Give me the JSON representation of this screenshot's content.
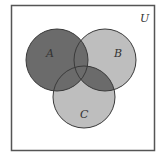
{
  "diagram": {
    "type": "venn",
    "universe_label": "U",
    "sets": [
      {
        "name": "A",
        "label": "A",
        "cx": 57,
        "cy": 60,
        "r": 31
      },
      {
        "name": "B",
        "label": "B",
        "cx": 105,
        "cy": 60,
        "r": 31
      },
      {
        "name": "C",
        "label": "C",
        "cx": 84,
        "cy": 97,
        "r": 31
      }
    ],
    "shaded_region": "A ∪ (B ∩ C)",
    "colors": {
      "shaded": "#6b6b6b",
      "unshaded_set": "#bebebe",
      "background": "#ffffff",
      "stroke": "#3a3a3a",
      "frame": "#555555"
    }
  }
}
